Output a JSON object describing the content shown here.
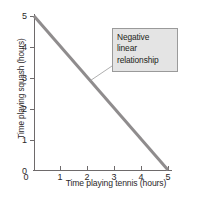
{
  "chart_data": {
    "type": "line",
    "title": "",
    "xlabel": "Time playing tennis (hours)",
    "ylabel": "Time playing squash (hours)",
    "xlim": [
      0,
      5
    ],
    "ylim": [
      0,
      5
    ],
    "xticks": [
      "0",
      "1",
      "2",
      "3",
      "4",
      "5"
    ],
    "yticks": [
      "0",
      "1",
      "2",
      "3",
      "4",
      "5"
    ],
    "grid": false,
    "legend": "none",
    "series": [
      {
        "name": "negative linear relationship",
        "x": [
          0,
          5
        ],
        "values": [
          5,
          0
        ],
        "color": "#8f8c8d"
      }
    ],
    "annotations": [
      {
        "name": "negative-linear-relationship-callout",
        "lines": [
          "Negative",
          "linear",
          "relationship"
        ],
        "box_fill": "#e4e4e4",
        "box_border": "#9a9a9a",
        "points_to_x": 2.1,
        "points_to_y": 2.9
      }
    ]
  },
  "axes": {
    "y_title": "Time playing squash (hours)",
    "x_title": "Time playing tennis (hours)",
    "axis_color": "#6e6a6b"
  }
}
